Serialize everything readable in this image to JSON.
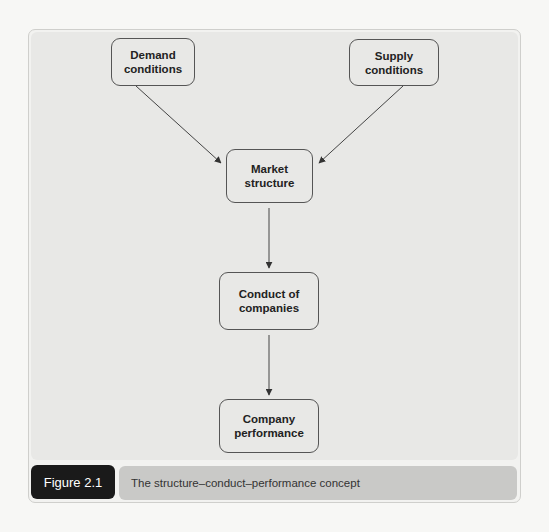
{
  "figure": {
    "label": "Figure 2.1",
    "caption": "The structure–conduct–performance concept"
  },
  "nodes": {
    "demand": "Demand\nconditions",
    "supply": "Supply\nconditions",
    "market": "Market\nstructure",
    "conduct": "Conduct of\ncompanies",
    "performance": "Company\nperformance"
  },
  "edges": [
    {
      "from": "demand",
      "to": "market"
    },
    {
      "from": "supply",
      "to": "market"
    },
    {
      "from": "market",
      "to": "conduct"
    },
    {
      "from": "conduct",
      "to": "performance"
    }
  ],
  "colors": {
    "panel": "#f2f2f0",
    "diagram_bg": "#e8e8e6",
    "node_border": "#555555",
    "arrow": "#444444",
    "figure_label_bg": "#1a1a1a",
    "caption_bg": "#c9c9c7"
  }
}
